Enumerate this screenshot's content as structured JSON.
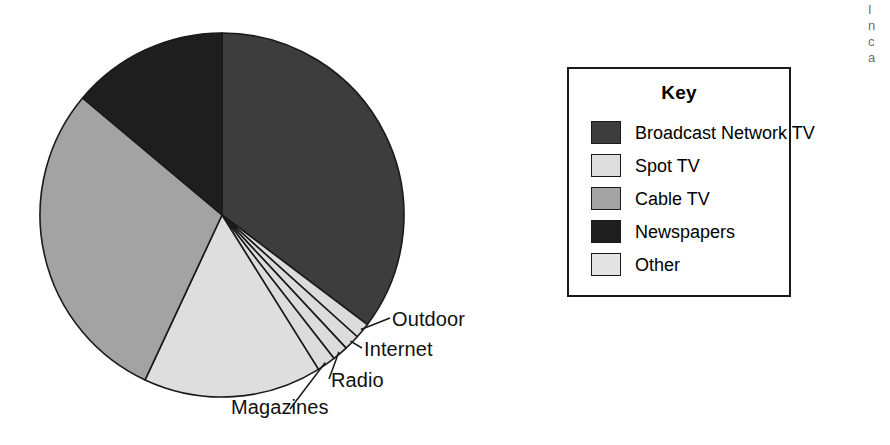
{
  "chart_data": {
    "type": "pie",
    "title": "",
    "legend_position": "right",
    "categories": [
      "Broadcast Network TV",
      "Outdoor",
      "Internet",
      "Radio",
      "Magazines",
      "Spot TV",
      "Cable TV",
      "Newspapers"
    ],
    "values": [
      35.3,
      1.4,
      1.4,
      1.4,
      1.7,
      15.8,
      29.2,
      13.8
    ],
    "start_angle_deg": 0,
    "direction": "clockwise",
    "slices": [
      {
        "label": "Broadcast Network TV",
        "value": 35.3,
        "start_deg": 0.0,
        "end_deg": 127.0,
        "color": "#3d3d3d",
        "labeled_in": "key"
      },
      {
        "label": "Outdoor",
        "value": 1.4,
        "start_deg": 127.0,
        "end_deg": 132.0,
        "color": "#dcdcdc",
        "labeled_in": "callout"
      },
      {
        "label": "Internet",
        "value": 1.4,
        "start_deg": 132.0,
        "end_deg": 137.0,
        "color": "#dcdcdc",
        "labeled_in": "callout"
      },
      {
        "label": "Radio",
        "value": 1.4,
        "start_deg": 137.0,
        "end_deg": 142.0,
        "color": "#dcdcdc",
        "labeled_in": "callout"
      },
      {
        "label": "Magazines",
        "value": 1.7,
        "start_deg": 142.0,
        "end_deg": 148.0,
        "color": "#dcdcdc",
        "labeled_in": "callout"
      },
      {
        "label": "Spot TV",
        "value": 15.8,
        "start_deg": 148.0,
        "end_deg": 205.0,
        "color": "#dedede",
        "labeled_in": "key"
      },
      {
        "label": "Cable TV",
        "value": 29.2,
        "start_deg": 205.0,
        "end_deg": 310.0,
        "color": "#a3a3a3",
        "labeled_in": "key"
      },
      {
        "label": "Newspapers",
        "value": 13.8,
        "start_deg": 310.0,
        "end_deg": 360.0,
        "color": "#1e1e1e",
        "labeled_in": "key"
      }
    ]
  },
  "pie": {
    "center_x": 222,
    "center_y": 215,
    "radius": 182,
    "outline_color": "#1a1a1a"
  },
  "callouts": [
    {
      "id": "outdoor",
      "text": "Outdoor"
    },
    {
      "id": "internet",
      "text": "Internet"
    },
    {
      "id": "radio",
      "text": "Radio"
    },
    {
      "id": "magazines",
      "text": "Magazines"
    }
  ],
  "legend": {
    "title": "Key",
    "entries": [
      {
        "label": "Broadcast Network TV",
        "color": "#3d3d3d"
      },
      {
        "label": "Spot TV",
        "color": "#dedede"
      },
      {
        "label": "Cable TV",
        "color": "#a3a3a3"
      },
      {
        "label": "Newspapers",
        "color": "#1e1e1e"
      },
      {
        "label": "Other",
        "color": "#e4e4e4"
      }
    ]
  },
  "margin_text": {
    "lines": [
      "I",
      "n",
      "c",
      "a"
    ]
  }
}
